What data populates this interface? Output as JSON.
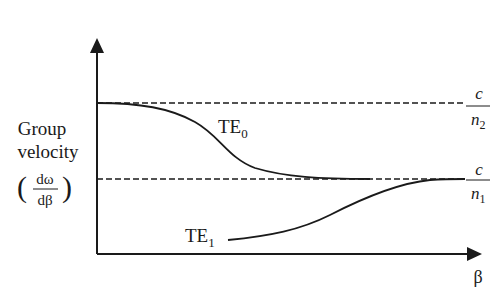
{
  "diagram": {
    "y_axis": {
      "label_line1": "Group",
      "label_line2": "velocity",
      "derivative_numerator": "dω",
      "derivative_denominator": "dβ",
      "paren_open": "(",
      "paren_close": ")"
    },
    "x_axis": {
      "label": "β"
    },
    "asymptotes": [
      {
        "id": "upper",
        "numerator": "c",
        "denominator_base": "n",
        "denominator_sub": "2",
        "style": "dashed"
      },
      {
        "id": "lower",
        "numerator": "c",
        "denominator_base": "n",
        "denominator_sub": "1",
        "style": "dashed"
      }
    ],
    "curves": [
      {
        "id": "TE0",
        "label_base": "TE",
        "label_sub": "0",
        "description": "starts at c/n2, decreases to c/n1"
      },
      {
        "id": "TE1",
        "label_base": "TE",
        "label_sub": "1",
        "description": "starts below c/n1, increases to c/n1"
      }
    ]
  },
  "colors": {
    "ink": "#1a1a1a",
    "background": "#ffffff"
  }
}
